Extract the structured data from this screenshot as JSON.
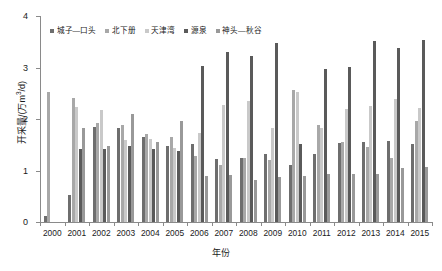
{
  "chart_data": {
    "type": "bar",
    "title": "",
    "xlabel": "年份",
    "ylabel": "开采量/(万m³/d)",
    "ylabel_parts": {
      "prefix": "开采量/(万m",
      "sup": "3",
      "suffix": "/d)"
    },
    "ylim": [
      0,
      4
    ],
    "yticks": [
      0,
      1,
      2,
      3,
      4
    ],
    "ytick_labels": [
      "0",
      "1",
      "2",
      "3",
      "4"
    ],
    "grid": false,
    "legend_position": "top-center",
    "categories": [
      "2000",
      "2001",
      "2002",
      "2003",
      "2004",
      "2005",
      "2006",
      "2007",
      "2008",
      "2009",
      "2010",
      "2011",
      "2012",
      "2013",
      "2014",
      "2015"
    ],
    "series": [
      {
        "name": "城子—口头",
        "color": "#6e6e6e",
        "values": [
          0.12,
          0.52,
          1.85,
          1.83,
          1.66,
          1.47,
          1.52,
          1.23,
          1.24,
          1.33,
          1.1,
          1.33,
          1.53,
          1.56,
          1.57,
          1.51
        ]
      },
      {
        "name": "北下册",
        "color": "#a8a8a8",
        "values": [
          2.52,
          2.4,
          1.92,
          1.88,
          1.7,
          1.66,
          1.28,
          1.11,
          1.25,
          1.21,
          2.57,
          1.89,
          1.55,
          1.46,
          1.24,
          1.97
        ]
      },
      {
        "name": "天津湾",
        "color": "#c9c9c9",
        "values": [
          0.0,
          2.23,
          2.18,
          1.6,
          1.62,
          1.44,
          1.72,
          2.27,
          2.35,
          1.82,
          2.52,
          1.83,
          2.2,
          2.26,
          2.38,
          2.21
        ]
      },
      {
        "name": "源泉",
        "color": "#5a5a5a",
        "values": [
          0.0,
          1.41,
          1.41,
          1.47,
          1.41,
          1.37,
          3.02,
          3.3,
          3.23,
          3.47,
          1.52,
          2.98,
          3.01,
          3.52,
          3.38,
          3.54
        ]
      },
      {
        "name": "神头—秋谷",
        "color": "#999999",
        "values": [
          0.0,
          1.82,
          1.48,
          2.09,
          1.56,
          1.96,
          0.9,
          0.92,
          0.82,
          0.87,
          0.9,
          0.94,
          0.94,
          0.93,
          1.04,
          1.07
        ]
      }
    ]
  }
}
